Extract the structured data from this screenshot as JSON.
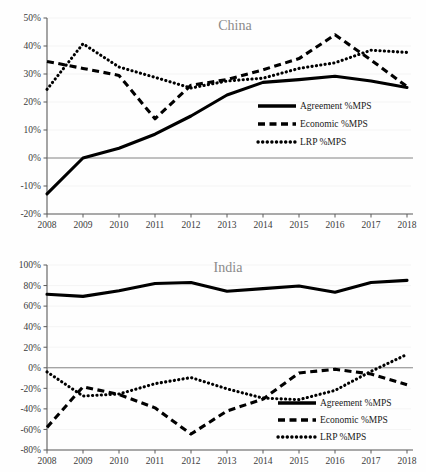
{
  "figure": {
    "background": "#fefefe",
    "line_color": "#000000",
    "title_color": "#8b8b8b",
    "axis_color": "#5a5a5a",
    "grid_color": "#f2f2f2"
  },
  "legend": {
    "agreement_label": "Agreement %MPS",
    "economic_label": "Economic %MPS",
    "lrp_label": "LRP %MPS"
  },
  "chart_data": [
    {
      "type": "line",
      "title": "China",
      "xlabel": "",
      "ylabel": "",
      "x": [
        2008,
        2009,
        2010,
        2011,
        2012,
        2013,
        2014,
        2015,
        2016,
        2017,
        2018
      ],
      "categories": [
        "2008",
        "2009",
        "2010",
        "2011",
        "2012",
        "2013",
        "2014",
        "2015",
        "2016",
        "2017",
        "2018"
      ],
      "ylim": [
        -20,
        50
      ],
      "ytick_labels": [
        "50%",
        "40%",
        "30%",
        "20%",
        "10%",
        "0%",
        "-10%",
        "-20%"
      ],
      "ytick_values": [
        50,
        40,
        30,
        20,
        10,
        0,
        -10,
        -20
      ],
      "grid": true,
      "legend_position": "center-right",
      "series": [
        {
          "name": "Agreement %MPS",
          "style": "solid",
          "values": [
            -12.8,
            0.0,
            3.5,
            8.5,
            15.0,
            22.5,
            27.0,
            28.0,
            29.2,
            27.5,
            25.2
          ]
        },
        {
          "name": "Economic %MPS",
          "style": "dashed",
          "values": [
            34.5,
            32.0,
            29.5,
            14.0,
            26.0,
            28.0,
            31.5,
            35.5,
            44.0,
            35.0,
            25.5
          ]
        },
        {
          "name": "LRP %MPS",
          "style": "dotted",
          "values": [
            24.5,
            40.8,
            32.5,
            28.8,
            25.0,
            27.5,
            28.5,
            32.0,
            34.0,
            38.5,
            37.7
          ]
        }
      ]
    },
    {
      "type": "line",
      "title": "India",
      "xlabel": "",
      "ylabel": "",
      "x": [
        2008,
        2009,
        2010,
        2011,
        2012,
        2013,
        2014,
        2015,
        2016,
        2017,
        2018
      ],
      "categories": [
        "2008",
        "2009",
        "2010",
        "2011",
        "2012",
        "2013",
        "2014",
        "2015",
        "2016",
        "2017",
        "2018"
      ],
      "ylim": [
        -80,
        100
      ],
      "ytick_labels": [
        "100%",
        "80%",
        "60%",
        "40%",
        "20%",
        "0%",
        "-20%",
        "-40%",
        "-60%",
        "-80%"
      ],
      "ytick_values": [
        100,
        80,
        60,
        40,
        20,
        0,
        -20,
        -40,
        -60,
        -80
      ],
      "grid": true,
      "legend_position": "bottom-right",
      "series": [
        {
          "name": "Agreement %MPS",
          "style": "solid",
          "values": [
            71.5,
            69.5,
            75.0,
            82.0,
            83.0,
            74.5,
            77.0,
            79.5,
            73.5,
            83.0,
            85.0
          ]
        },
        {
          "name": "Economic %MPS",
          "style": "dashed",
          "values": [
            -58.0,
            -18.5,
            -26.0,
            -39.0,
            -64.5,
            -42.0,
            -30.5,
            -5.0,
            -1.5,
            -6.0,
            -16.5
          ]
        },
        {
          "name": "LRP %MPS",
          "style": "dotted",
          "values": [
            -4.0,
            -27.5,
            -25.5,
            -15.5,
            -9.5,
            -20.5,
            -29.5,
            -31.0,
            -22.0,
            -3.5,
            13.0
          ]
        }
      ]
    }
  ]
}
